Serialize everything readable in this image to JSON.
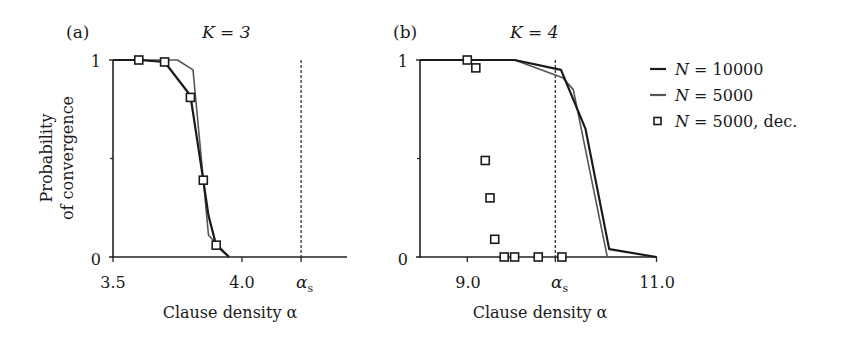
{
  "chart_data": [
    {
      "panel": "(a)",
      "title": "K = 3",
      "type": "line",
      "xlabel": "Clause density α",
      "ylabel": "Probability of convergence",
      "xlim": [
        3.5,
        4.4
      ],
      "ylim": [
        0,
        1
      ],
      "xticks": [
        {
          "value": 3.5,
          "label": "3.5"
        },
        {
          "value": 4.0,
          "label": "4.0"
        },
        {
          "value": 4.229,
          "label": "α_s"
        }
      ],
      "yticks": [
        {
          "value": 0,
          "label": "0"
        },
        {
          "value": 0.5,
          "label": ""
        },
        {
          "value": 1,
          "label": "1"
        }
      ],
      "vline": {
        "x": 4.229,
        "label": "α_s",
        "style": "dashed"
      },
      "series": [
        {
          "name": "N = 10000",
          "style": "line",
          "color": "#1a1a1a",
          "x": [
            3.5,
            3.6,
            3.7,
            3.8,
            3.85,
            3.87,
            3.9,
            3.95
          ],
          "y": [
            1.0,
            1.0,
            0.99,
            0.82,
            0.39,
            0.21,
            0.06,
            0.0
          ]
        },
        {
          "name": "N = 5000",
          "style": "line",
          "color": "#555555",
          "x": [
            3.5,
            3.75,
            3.81,
            3.87,
            3.9,
            3.95
          ],
          "y": [
            1.0,
            1.0,
            0.95,
            0.11,
            0.07,
            0.0
          ]
        },
        {
          "name": "N = 5000, dec.",
          "style": "marker-square",
          "color": "#1a1a1a",
          "x": [
            3.6,
            3.7,
            3.8,
            3.85,
            3.9
          ],
          "y": [
            1.0,
            0.99,
            0.81,
            0.39,
            0.06
          ]
        }
      ]
    },
    {
      "panel": "(b)",
      "title": "K = 4",
      "type": "line",
      "xlabel": "Clause density α",
      "ylabel": "",
      "xlim": [
        8.5,
        11.0
      ],
      "ylim": [
        0,
        1
      ],
      "xticks": [
        {
          "value": 9.0,
          "label": "9.0"
        },
        {
          "value": 9.93,
          "label": "α_s"
        },
        {
          "value": 11.0,
          "label": "11.0"
        }
      ],
      "yticks": [
        {
          "value": 0,
          "label": "0"
        },
        {
          "value": 0.5,
          "label": ""
        },
        {
          "value": 1,
          "label": "1"
        }
      ],
      "vline": {
        "x": 9.93,
        "label": "α_s",
        "style": "dashed"
      },
      "series": [
        {
          "name": "N = 10000",
          "style": "line",
          "color": "#1a1a1a",
          "x": [
            8.5,
            9.5,
            9.99,
            10.25,
            10.5,
            11.0
          ],
          "y": [
            1.0,
            1.0,
            0.95,
            0.65,
            0.04,
            0.0
          ]
        },
        {
          "name": "N = 5000",
          "style": "line",
          "color": "#555555",
          "x": [
            8.5,
            9.5,
            10.01,
            10.12,
            10.48,
            11.0
          ],
          "y": [
            1.0,
            1.0,
            0.91,
            0.85,
            0.0,
            0.0
          ]
        },
        {
          "name": "N = 5000, dec.",
          "style": "marker-square",
          "color": "#1a1a1a",
          "x": [
            9.0,
            9.09,
            9.19,
            9.24,
            9.29,
            9.39,
            9.5,
            9.75,
            10.0
          ],
          "y": [
            1.0,
            0.96,
            0.49,
            0.3,
            0.09,
            0.0,
            0.0,
            0.0,
            0.0
          ]
        }
      ]
    }
  ],
  "legend": {
    "position": "right",
    "entries": [
      {
        "label": "N = 10000",
        "symbol": "line",
        "color": "#1a1a1a"
      },
      {
        "label": "N = 5000",
        "symbol": "line",
        "color": "#555555"
      },
      {
        "label": "N = 5000, dec.",
        "symbol": "square",
        "color": "#1a1a1a"
      }
    ]
  },
  "labels": {
    "a_panel": "(a)",
    "a_title": "K = 3",
    "b_panel": "(b)",
    "b_title": "K = 4",
    "ylabel_line1": "Probability",
    "ylabel_line2": "of convergence",
    "xlabel": "Clause density α",
    "alpha_s": "α",
    "alpha_s_sub": "s",
    "a_ticks": {
      "x0": "3.5",
      "x1": "4.0",
      "y0": "0",
      "y1": "1"
    },
    "b_ticks": {
      "x0": "9.0",
      "x1": "11.0",
      "y0": "0",
      "y1": "1"
    }
  }
}
